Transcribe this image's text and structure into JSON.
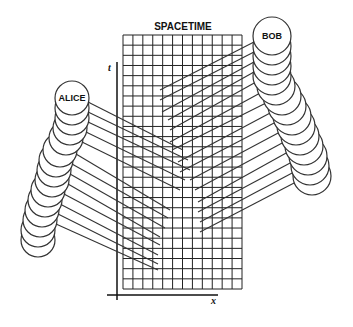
{
  "title": "SPACETIME",
  "axes": {
    "t_label": "t",
    "x_label": "x"
  },
  "observers": [
    {
      "name": "ALICE",
      "label": "ALICE"
    },
    {
      "name": "BOB",
      "label": "BOB"
    }
  ],
  "colors": {
    "stroke": "#333333",
    "grid": "#222222",
    "background": "#ffffff"
  },
  "grid": {
    "x0": 123,
    "y0": 35,
    "x1": 242,
    "y1": 289,
    "cols": 12,
    "rows": 25
  },
  "alice_circles": [
    [
      72,
      98
    ],
    [
      72,
      108
    ],
    [
      72,
      118
    ],
    [
      70,
      128
    ],
    [
      66,
      138
    ],
    [
      60,
      150
    ],
    [
      56,
      160
    ],
    [
      54,
      170
    ],
    [
      52,
      180
    ],
    [
      48,
      190
    ],
    [
      45,
      200
    ],
    [
      42,
      210
    ],
    [
      40,
      220
    ],
    [
      38,
      230
    ],
    [
      38,
      240
    ]
  ],
  "bob_circles": [
    [
      272,
      36
    ],
    [
      272,
      46
    ],
    [
      272,
      56
    ],
    [
      272,
      66
    ],
    [
      272,
      76
    ],
    [
      276,
      86
    ],
    [
      282,
      96
    ],
    [
      287,
      106
    ],
    [
      292,
      116
    ],
    [
      296,
      126
    ],
    [
      300,
      136
    ],
    [
      304,
      146
    ],
    [
      308,
      156
    ],
    [
      310,
      166
    ],
    [
      312,
      176
    ]
  ],
  "alice_lines": [
    [
      [
        88,
        102
      ],
      [
        183,
        150
      ]
    ],
    [
      [
        88,
        112
      ],
      [
        188,
        160
      ]
    ],
    [
      [
        88,
        122
      ],
      [
        190,
        170
      ]
    ],
    [
      [
        86,
        132
      ],
      [
        185,
        180
      ]
    ],
    [
      [
        82,
        142
      ],
      [
        180,
        190
      ]
    ],
    [
      [
        76,
        154
      ],
      [
        170,
        210
      ]
    ],
    [
      [
        72,
        164
      ],
      [
        168,
        218
      ]
    ],
    [
      [
        70,
        174
      ],
      [
        165,
        228
      ]
    ],
    [
      [
        68,
        184
      ],
      [
        160,
        237
      ]
    ],
    [
      [
        64,
        194
      ],
      [
        160,
        245
      ]
    ],
    [
      [
        60,
        204
      ],
      [
        158,
        255
      ]
    ],
    [
      [
        58,
        214
      ],
      [
        158,
        264
      ]
    ],
    [
      [
        56,
        224
      ],
      [
        158,
        270
      ]
    ]
  ],
  "bob_lines": [
    [
      [
        254,
        42
      ],
      [
        160,
        90
      ]
    ],
    [
      [
        254,
        52
      ],
      [
        160,
        100
      ]
    ],
    [
      [
        254,
        62
      ],
      [
        162,
        112
      ]
    ],
    [
      [
        254,
        72
      ],
      [
        168,
        120
      ]
    ],
    [
      [
        256,
        82
      ],
      [
        170,
        130
      ]
    ],
    [
      [
        262,
        92
      ],
      [
        170,
        142
      ]
    ],
    [
      [
        268,
        102
      ],
      [
        172,
        150
      ]
    ],
    [
      [
        272,
        112
      ],
      [
        178,
        162
      ]
    ],
    [
      [
        276,
        122
      ],
      [
        180,
        172
      ]
    ],
    [
      [
        280,
        132
      ],
      [
        190,
        180
      ]
    ],
    [
      [
        284,
        142
      ],
      [
        195,
        190
      ]
    ],
    [
      [
        288,
        152
      ],
      [
        198,
        202
      ]
    ],
    [
      [
        292,
        162
      ],
      [
        198,
        212
      ]
    ],
    [
      [
        294,
        172
      ],
      [
        200,
        222
      ]
    ],
    [
      [
        296,
        182
      ],
      [
        200,
        232
      ]
    ]
  ]
}
